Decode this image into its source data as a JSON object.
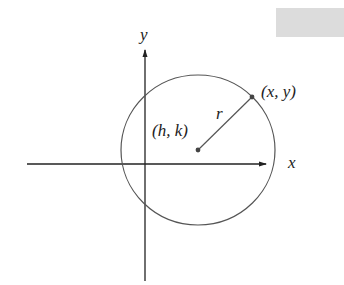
{
  "diagram": {
    "labels": {
      "y_axis": "y",
      "x_axis": "x",
      "center": "(h, k)",
      "point": "(x, y)",
      "radius": "r"
    },
    "colors": {
      "axis": "#222222",
      "circle": "#555555",
      "radius_line": "#555555",
      "point": "#444444",
      "gray_box": "#dcdcdc"
    },
    "geometry": {
      "origin": [
        145,
        164
      ],
      "center": [
        198,
        150
      ],
      "radius": 76,
      "point_on_circle": [
        252,
        97
      ]
    }
  }
}
